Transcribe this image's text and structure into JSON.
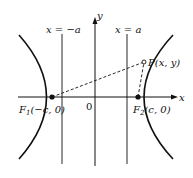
{
  "diagram": {
    "type": "hyperbola-foci",
    "axes": {
      "x_label": "x",
      "y_label": "y",
      "origin_label": "0"
    },
    "lines": {
      "left_line_label": "x = −a",
      "right_line_label": "x = a"
    },
    "foci": {
      "f1": {
        "name": "F",
        "sub": "1",
        "coords": "(−c, 0)"
      },
      "f2": {
        "name": "F",
        "sub": "2",
        "coords": "(c, 0)"
      }
    },
    "point": {
      "label": "P(x, y)"
    },
    "colors": {
      "ink": "#111111",
      "background": "#ffffff"
    }
  }
}
